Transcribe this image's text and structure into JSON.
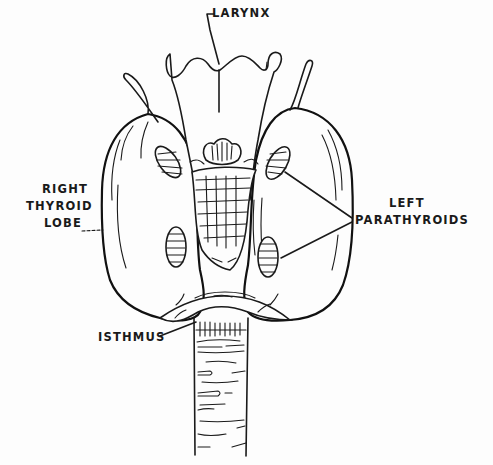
{
  "diagram": {
    "labels": {
      "larynx": "LARYNX",
      "right_lobe_line1": "RIGHT",
      "right_lobe_line2": "THYROID",
      "right_lobe_line3": "LOBE",
      "left_parathyroids_line1": "LEFT",
      "left_parathyroids_line2": "PARATHYROIDS",
      "isthmus": "ISTHMUS"
    },
    "colors": {
      "ink": "#1a1a1a",
      "background": "#fdfdfd"
    }
  }
}
